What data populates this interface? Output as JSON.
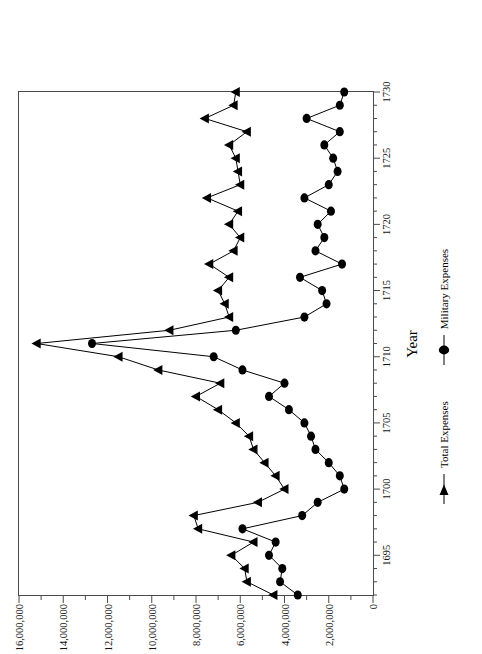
{
  "chart_data": {
    "type": "line",
    "title": "",
    "subtitle": "",
    "xlabel": "Year",
    "ylabel": "Pounds",
    "xlim": [
      1692,
      1730
    ],
    "ylim": [
      0,
      16000000
    ],
    "grid": false,
    "legend_position": "below",
    "x_tick_labels": [
      "1695",
      "1700",
      "1705",
      "1710",
      "1715",
      "1720",
      "1725",
      "1730"
    ],
    "x_tick_values": [
      1695,
      1700,
      1705,
      1710,
      1715,
      1720,
      1725,
      1730
    ],
    "x_minor_tick_step": 1,
    "y_tick_labels": [
      "0",
      "2,000,000",
      "4,000,000",
      "6,000,000",
      "8,000,000",
      "10,000,000",
      "12,000,000",
      "14,000,000",
      "16,000,000"
    ],
    "y_tick_values": [
      0,
      2000000,
      4000000,
      6000000,
      8000000,
      10000000,
      12000000,
      14000000,
      16000000
    ],
    "x": [
      1692,
      1693,
      1694,
      1695,
      1696,
      1697,
      1698,
      1699,
      1700,
      1701,
      1702,
      1703,
      1704,
      1705,
      1706,
      1707,
      1708,
      1709,
      1710,
      1711,
      1712,
      1713,
      1714,
      1715,
      1716,
      1717,
      1718,
      1719,
      1720,
      1721,
      1722,
      1723,
      1724,
      1725,
      1726,
      1727,
      1728,
      1729,
      1730
    ],
    "series": [
      {
        "name": "Total Expenses",
        "marker": "triangle",
        "color": "#000000",
        "values": [
          4500000,
          5700000,
          5800000,
          6400000,
          5400000,
          7900000,
          8100000,
          5200000,
          4000000,
          4400000,
          4900000,
          5400000,
          5600000,
          6200000,
          7000000,
          8000000,
          6900000,
          9700000,
          11500000,
          15200000,
          9200000,
          6500000,
          6700000,
          7000000,
          6500000,
          7400000,
          6300000,
          6000000,
          6500000,
          6100000,
          7500000,
          6000000,
          6100000,
          6200000,
          6500000,
          5700000,
          7600000,
          6300000,
          6200000
        ]
      },
      {
        "name": "Military Expenses",
        "marker": "circle",
        "color": "#000000",
        "values": [
          3400000,
          4200000,
          4100000,
          4700000,
          4400000,
          5900000,
          3200000,
          2500000,
          1300000,
          1500000,
          2000000,
          2600000,
          2800000,
          3100000,
          3800000,
          4700000,
          4000000,
          5900000,
          7200000,
          12700000,
          6200000,
          3100000,
          2100000,
          2300000,
          3300000,
          1400000,
          2600000,
          2200000,
          2500000,
          1900000,
          3100000,
          2000000,
          1600000,
          1800000,
          2200000,
          1500000,
          3000000,
          1500000,
          1300000
        ]
      }
    ]
  },
  "axes": {
    "x_title": "Year",
    "y_title": "Pounds"
  },
  "legend": {
    "entries": [
      {
        "label": "Total Expenses",
        "marker": "triangle-marker"
      },
      {
        "label": "Military Expenses",
        "marker": "circle-marker"
      }
    ]
  }
}
